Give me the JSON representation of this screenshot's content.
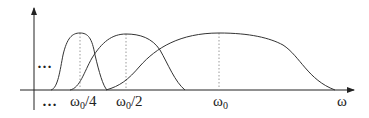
{
  "diagram": {
    "type": "frequency-domain filter bank (dyadic band-pass responses)",
    "colors": {
      "curve": "#333333",
      "axis": "#222222",
      "guide": "#9a9a9a",
      "background": "#ffffff"
    },
    "axes": {
      "x_label": "ω",
      "y_label": ""
    },
    "ellipsis_left": "…",
    "ellipsis_bottom": "…",
    "bands": [
      {
        "center_label": "ω",
        "center_subscript": "0",
        "center_suffix": "/4"
      },
      {
        "center_label": "ω",
        "center_subscript": "0",
        "center_suffix": "/2"
      },
      {
        "center_label": "ω",
        "center_subscript": "0",
        "center_suffix": ""
      }
    ]
  }
}
